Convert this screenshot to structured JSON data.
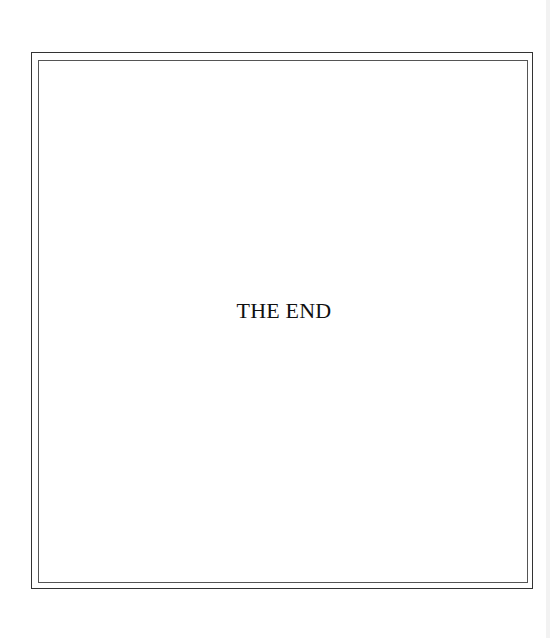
{
  "page": {
    "text": "THE END",
    "border_color": "#333333",
    "background": "#ffffff"
  }
}
